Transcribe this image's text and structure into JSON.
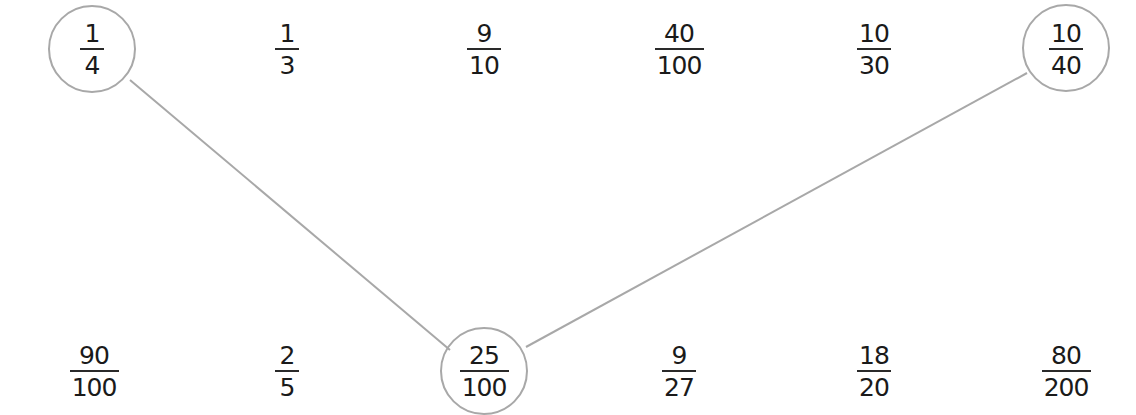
{
  "diagram": {
    "line_color": "#a8a8a8",
    "circle_color": "#a8a8a8",
    "top_row": [
      {
        "num": "1",
        "den": "4",
        "circled": true
      },
      {
        "num": "1",
        "den": "3",
        "circled": false
      },
      {
        "num": "9",
        "den": "10",
        "circled": false
      },
      {
        "num": "40",
        "den": "100",
        "circled": false
      },
      {
        "num": "10",
        "den": "30",
        "circled": false
      },
      {
        "num": "10",
        "den": "40",
        "circled": true
      }
    ],
    "bottom_row": [
      {
        "num": "90",
        "den": "100",
        "circled": false
      },
      {
        "num": "2",
        "den": "5",
        "circled": false
      },
      {
        "num": "25",
        "den": "100",
        "circled": true
      },
      {
        "num": "9",
        "den": "27",
        "circled": false
      },
      {
        "num": "18",
        "den": "20",
        "circled": false
      },
      {
        "num": "80",
        "den": "200",
        "circled": false
      }
    ],
    "connections": [
      {
        "from": "1/4",
        "to": "25/100"
      },
      {
        "from": "10/40",
        "to": "25/100"
      }
    ]
  }
}
